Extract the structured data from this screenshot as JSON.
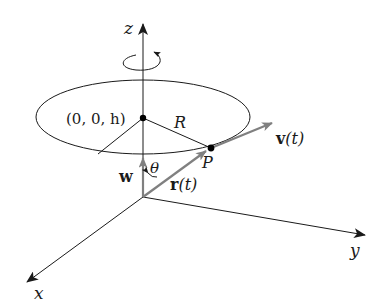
{
  "diagram": {
    "type": "3d-vector-diagram",
    "axes": {
      "x_label": "x",
      "y_label": "y",
      "z_label": "z"
    },
    "labels": {
      "center_point": "(0, 0, h)",
      "radius": "R",
      "point": "P",
      "velocity": "v",
      "velocity_arg": "(t)",
      "position": "r",
      "position_arg": "(t)",
      "angular_velocity": "w",
      "angle": "θ"
    },
    "colors": {
      "line": "#1a1a1a",
      "vector": "#808080",
      "background": "#ffffff"
    }
  }
}
